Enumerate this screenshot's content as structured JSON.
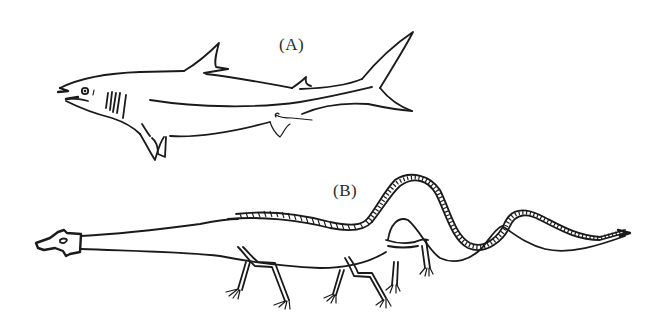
{
  "figure": {
    "panels": [
      {
        "id": "A",
        "label": "(A)",
        "subject": "shark"
      },
      {
        "id": "B",
        "label": "(B)",
        "subject": "long-necked serpentine creature"
      }
    ]
  },
  "colors": {
    "background": "#ffffff",
    "ink": "#1a1a1a"
  }
}
